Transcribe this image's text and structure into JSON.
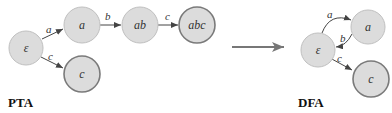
{
  "colors": {
    "node_fill": "#dcdcdc",
    "node_stroke": "#b8b8b8",
    "accept_stroke": "#7a7a7a",
    "edge": "#444444",
    "transform_arrow": "#777777"
  },
  "pta": {
    "caption": "PTA",
    "nodes": [
      {
        "id": "eps",
        "label": "ε",
        "accepting": false
      },
      {
        "id": "a",
        "label": "a",
        "accepting": false
      },
      {
        "id": "ab",
        "label": "ab",
        "accepting": false
      },
      {
        "id": "abc",
        "label": "abc",
        "accepting": true
      },
      {
        "id": "c",
        "label": "c",
        "accepting": true
      }
    ],
    "edges": [
      {
        "from": "eps",
        "to": "a",
        "label": "a"
      },
      {
        "from": "a",
        "to": "ab",
        "label": "b"
      },
      {
        "from": "ab",
        "to": "abc",
        "label": "c"
      },
      {
        "from": "eps",
        "to": "c",
        "label": "c"
      }
    ]
  },
  "dfa": {
    "caption": "DFA",
    "nodes": [
      {
        "id": "eps",
        "label": "ε",
        "accepting": false
      },
      {
        "id": "a",
        "label": "a",
        "accepting": false
      },
      {
        "id": "c",
        "label": "c",
        "accepting": true
      }
    ],
    "edges": [
      {
        "from": "eps",
        "to": "a",
        "label": "a"
      },
      {
        "from": "a",
        "to": "eps",
        "label": "b"
      },
      {
        "from": "eps",
        "to": "c",
        "label": "c"
      }
    ]
  }
}
